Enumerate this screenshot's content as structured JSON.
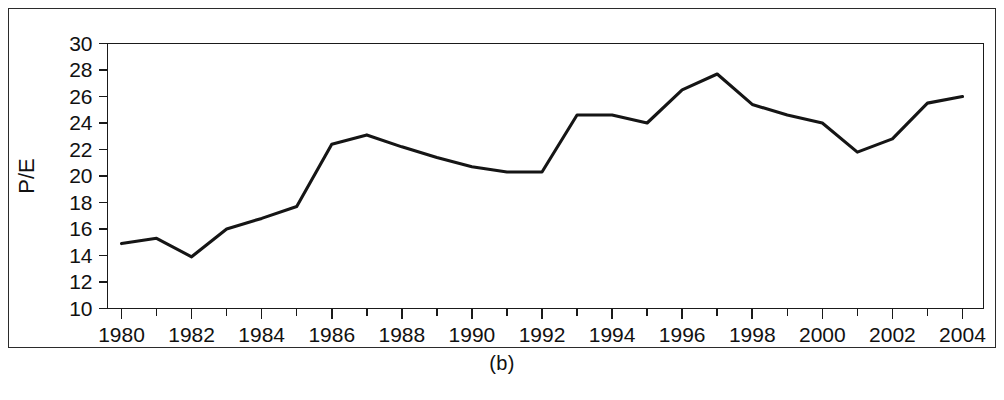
{
  "figure": {
    "caption": "(b)",
    "border_color": "#2b2b2b",
    "background": "#ffffff"
  },
  "chart_data": {
    "type": "line",
    "title": "",
    "subtitle": "",
    "xlabel": "",
    "ylabel": "P/E",
    "line_color": "#151515",
    "grid": false,
    "legend": false,
    "legend_position": "none",
    "xlim": [
      1979.6,
      2004.6
    ],
    "ylim": [
      10,
      30
    ],
    "ytick_step": 2,
    "xtick_step": 2,
    "x_minor_ticks": true,
    "y_tick_labels": [
      "10",
      "12",
      "14",
      "16",
      "18",
      "20",
      "22",
      "24",
      "26",
      "28",
      "30"
    ],
    "y_ticks": [
      10,
      12,
      14,
      16,
      18,
      20,
      22,
      24,
      26,
      28,
      30
    ],
    "x_tick_labels": [
      "1980",
      "1982",
      "1984",
      "1986",
      "1988",
      "1990",
      "1992",
      "1994",
      "1996",
      "1998",
      "2000",
      "2002",
      "2004"
    ],
    "x_ticks": [
      1980,
      1982,
      1984,
      1986,
      1988,
      1990,
      1992,
      1994,
      1996,
      1998,
      2000,
      2002,
      2004
    ],
    "x": [
      1980,
      1981,
      1982,
      1983,
      1984,
      1985,
      1986,
      1987,
      1988,
      1989,
      1990,
      1991,
      1992,
      1993,
      1994,
      1995,
      1996,
      1997,
      1998,
      1999,
      2000,
      2001,
      2002,
      2003,
      2004
    ],
    "values": [
      14.9,
      15.3,
      13.9,
      16.0,
      16.8,
      17.7,
      22.4,
      23.1,
      22.2,
      21.4,
      20.7,
      20.3,
      20.3,
      24.6,
      24.6,
      24.0,
      26.5,
      27.7,
      25.4,
      24.6,
      24.0,
      21.8,
      22.8,
      25.5,
      26.0
    ],
    "series": [
      {
        "name": "P/E",
        "values": [
          14.9,
          15.3,
          13.9,
          16.0,
          16.8,
          17.7,
          22.4,
          23.1,
          22.2,
          21.4,
          20.7,
          20.3,
          20.3,
          24.6,
          24.6,
          24.0,
          26.5,
          27.7,
          25.4,
          24.6,
          24.0,
          21.8,
          22.8,
          25.5,
          26.0
        ]
      }
    ],
    "annotations": []
  }
}
